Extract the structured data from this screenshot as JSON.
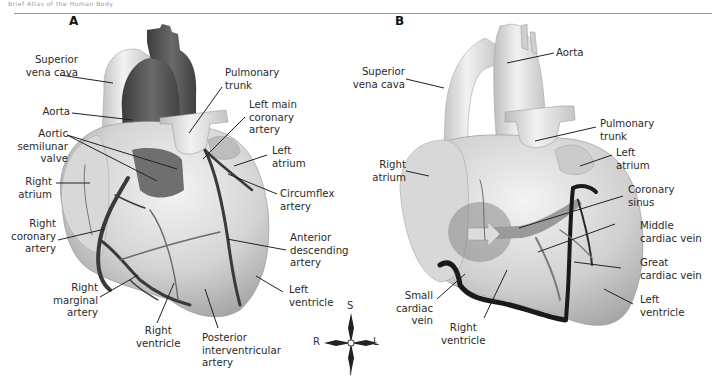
{
  "header": {
    "running_text": "Brief Atlas of the Human Body"
  },
  "panels": [
    {
      "letter": "A",
      "view": "anterior",
      "labels": {
        "superior_vena_cava": "Superior\nvena cava",
        "aorta": "Aorta",
        "aortic_semilunar_valve": "Aortic\nsemilunar\nvalve",
        "right_atrium": "Right\natrium",
        "right_coronary_artery": "Right\ncoronary\nartery",
        "right_marginal_artery": "Right\nmarginal\nartery",
        "right_ventricle": "Right\nventricle",
        "posterior_interventricular_artery": "Posterior\ninterventricular\nartery",
        "pulmonary_trunk": "Pulmonary\ntrunk",
        "left_main_coronary_artery": "Left main\ncoronary\nartery",
        "left_atrium": "Left\natrium",
        "circumflex_artery": "Circumflex\nartery",
        "anterior_descending_artery": "Anterior\ndescending\nartery",
        "left_ventricle": "Left\nventricle"
      }
    },
    {
      "letter": "B",
      "view": "posterior",
      "labels": {
        "superior_vena_cava": "Superior\nvena cava",
        "aorta": "Aorta",
        "right_atrium": "Right\natrium",
        "pulmonary_trunk": "Pulmonary\ntrunk",
        "left_atrium": "Left\natrium",
        "coronary_sinus": "Coronary\nsinus",
        "middle_cardiac_vein": "Middle\ncardiac vein",
        "great_cardiac_vein": "Great\ncardiac vein",
        "left_ventricle": "Left\nventricle",
        "small_cardiac_vein": "Small\ncardiac\nvein",
        "right_ventricle": "Right\nventricle"
      }
    }
  ],
  "compass": {
    "superior": "S",
    "inferior": "I",
    "right": "R",
    "left": "L"
  },
  "colors": {
    "heart_light": "#e6e6e6",
    "heart_mid": "#c4c4c4",
    "heart_shadow": "#9d9d9d",
    "aorta_dark": "#555555",
    "vessel_dark": "#3a3a3a",
    "vein_black": "#1a1a1a",
    "leader_line": "#222222",
    "text": "#2a2a2a"
  }
}
